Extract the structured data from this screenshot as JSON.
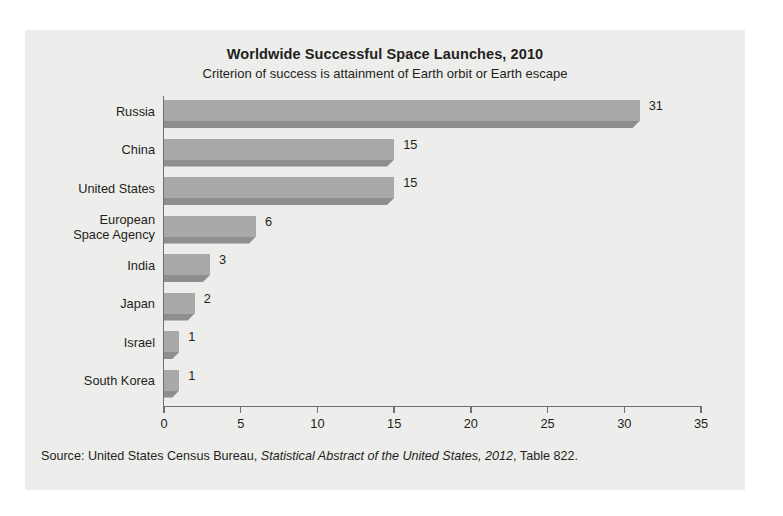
{
  "chart_data": {
    "type": "bar",
    "orientation": "horizontal",
    "title": "Worldwide Successful Space Launches, 2010",
    "subtitle": "Criterion of success is attainment of Earth orbit or Earth escape",
    "xlabel": "",
    "ylabel": "",
    "xlim": [
      0,
      35
    ],
    "xticks": [
      0,
      5,
      10,
      15,
      20,
      25,
      30,
      35
    ],
    "xtick_labels": [
      "0",
      "5",
      "10",
      "15",
      "20",
      "25",
      "30",
      "35"
    ],
    "grid": false,
    "legend": false,
    "categories": [
      "Russia",
      "China",
      "United States",
      "European\nSpace Agency",
      "India",
      "Japan",
      "Israel",
      "South Korea"
    ],
    "values": [
      31,
      15,
      15,
      6,
      3,
      2,
      1,
      1
    ],
    "value_labels": [
      "31",
      "15",
      "15",
      "6",
      "3",
      "2",
      "1",
      "1"
    ],
    "bar_color": "#a9a9a7",
    "bar_shadow_color": "#8e8e8c",
    "panel_color": "#ededeb",
    "axis_color": "#6f6f6f",
    "text_color": "#231f20"
  },
  "source": {
    "prefix": "Source: United States Census Bureau, ",
    "italic": "Statistical Abstract of the United States, 2012",
    "suffix": ", Table 822."
  }
}
